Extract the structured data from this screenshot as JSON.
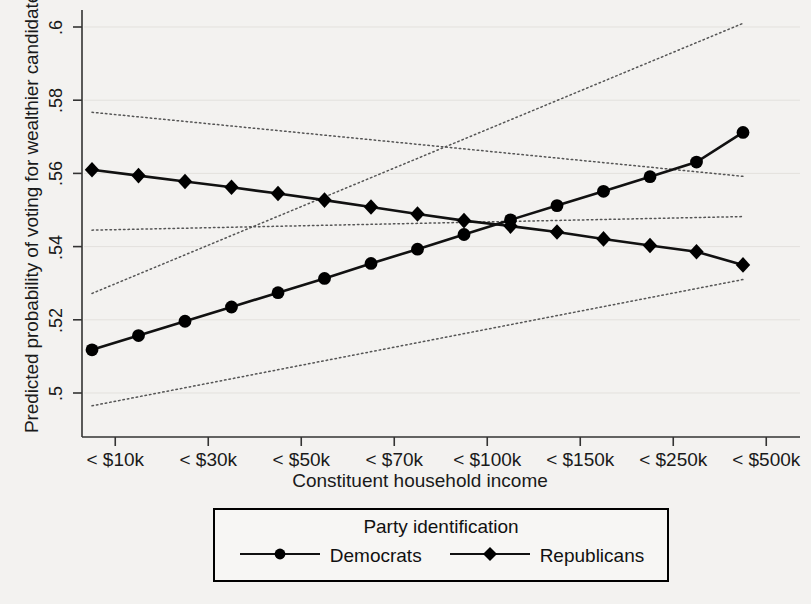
{
  "chart_data": {
    "type": "line",
    "title": "",
    "xlabel": "Constituent household income",
    "ylabel": "Predicted probability of voting for wealthier candidate",
    "ylim": [
      0.495,
      0.605
    ],
    "yticks": [
      0.5,
      0.52,
      0.54,
      0.56,
      0.58,
      0.6
    ],
    "ytick_labels": [
      ".5",
      ".52",
      ".54",
      ".56",
      ".58",
      ".6"
    ],
    "xtick_labels": [
      "< $10k",
      "< $30k",
      "< $50k",
      "< $70k",
      "< $100k",
      "< $150k",
      "< $250k",
      "< $500k"
    ],
    "xtick_positions": [
      0.5,
      2.5,
      4.5,
      6.5,
      8.5,
      10.5,
      12.5,
      14.5
    ],
    "grid": false,
    "legend": {
      "title": "Party identification",
      "position": "below-axes",
      "entries": [
        {
          "name": "Democrats",
          "marker": "circle"
        },
        {
          "name": "Republicans",
          "marker": "diamond"
        }
      ]
    },
    "x": [
      0,
      1,
      2,
      3,
      4,
      5,
      6,
      7,
      8,
      9,
      10,
      11,
      12,
      13,
      14
    ],
    "series": [
      {
        "name": "Democrats",
        "marker": "circle",
        "values": [
          0.5118,
          0.5157,
          0.5196,
          0.5235,
          0.5274,
          0.5313,
          0.5354,
          0.5393,
          0.5433,
          0.5473,
          0.5512,
          0.5551,
          0.5591,
          0.5631,
          0.5712
        ]
      },
      {
        "name": "Republicans",
        "marker": "diamond",
        "values": [
          0.561,
          0.5594,
          0.5578,
          0.5562,
          0.5545,
          0.5527,
          0.5508,
          0.5489,
          0.5471,
          0.5456,
          0.544,
          0.5421,
          0.5403,
          0.5386,
          0.535
        ]
      }
    ],
    "confidence_bands": [
      {
        "name": "Democrats upper",
        "style": "dotted",
        "x": [
          0,
          14
        ],
        "values": [
          0.5272,
          0.601
        ]
      },
      {
        "name": "Democrats lower",
        "style": "dotted",
        "x": [
          0,
          14
        ],
        "values": [
          0.4965,
          0.531
        ]
      },
      {
        "name": "Republicans upper",
        "style": "dotted",
        "x": [
          0,
          14
        ],
        "values": [
          0.5767,
          0.5592
        ]
      },
      {
        "name": "Republicans lower",
        "style": "dotted",
        "x": [
          0,
          14
        ],
        "values": [
          0.5445,
          0.5482
        ]
      }
    ],
    "colors": {
      "line": "#111111",
      "marker": "#000000",
      "ci": "#555555",
      "axis": "#333333",
      "background": "#f3f2f0"
    }
  }
}
